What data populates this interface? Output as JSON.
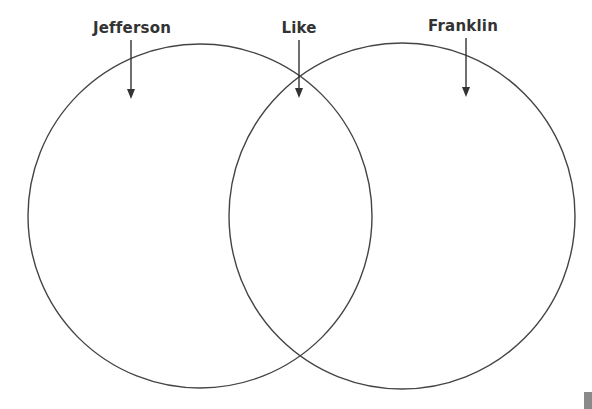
{
  "diagram": {
    "type": "venn",
    "sets": [
      {
        "id": "left",
        "label": "Jefferson",
        "cx": 200,
        "cy": 216,
        "r": 172
      },
      {
        "id": "right",
        "label": "Franklin",
        "cx": 402,
        "cy": 216,
        "r": 173
      }
    ],
    "intersection_label": "Like",
    "labels": {
      "left": "Jefferson",
      "center": "Like",
      "right": "Franklin"
    },
    "colors": {
      "stroke": "#444444",
      "text": "#333333",
      "background": "#ffffff"
    }
  }
}
